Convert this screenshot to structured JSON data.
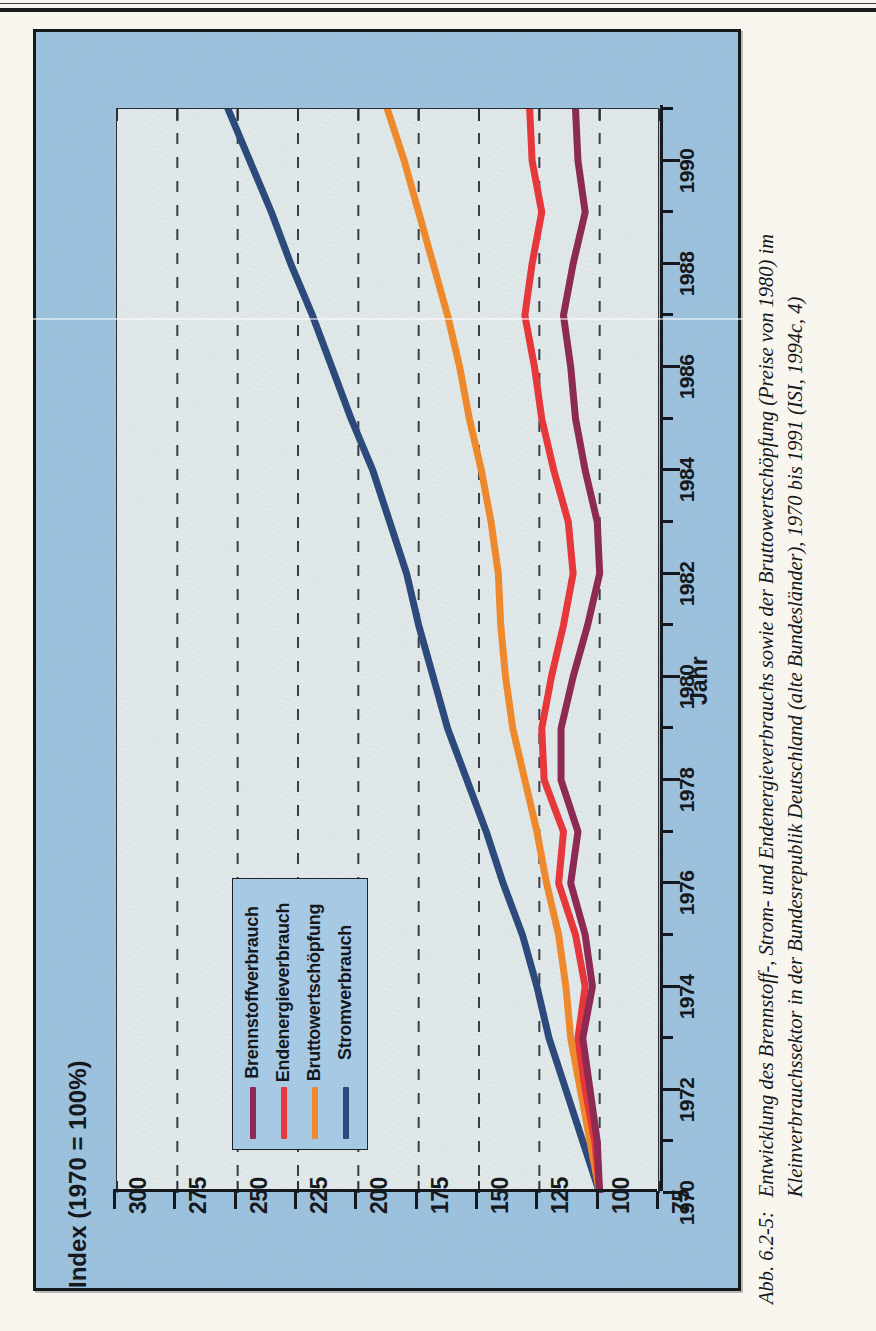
{
  "figure": {
    "caption_number": "Abb. 6.2-5:",
    "caption_text": "Entwicklung des Brennstoff-, Strom- und Endenergieverbrauchs sowie der Bruttowertschöpfung (Preise von 1980) im Kleinverbrauchssektor in der Bundesrepublik Deutschland (alte Bundesländer), 1970 bis 1991 (ISI, 1994c, 4)"
  },
  "colors": {
    "panel_background": "#9cc3e0",
    "plot_background": "#e4ecee",
    "legend_background": "#a8cbe6",
    "axis": "#15181c",
    "gridline": "#3a3f46",
    "stromverbrauch": "#2c4a7c",
    "bruttowertschoepfung": "#f08a2c",
    "endenergieverbrauch": "#e8383c",
    "brennstoffverbrauch": "#8e2a55"
  },
  "chart_data": {
    "type": "line",
    "title": "",
    "orientation": "rotated-90-ccw",
    "xlabel": "Jahr",
    "ylabel": "Index (1970 = 100%)",
    "xlim": [
      1970,
      1991
    ],
    "ylim": [
      75,
      300
    ],
    "yticks": [
      300,
      275,
      250,
      225,
      200,
      175,
      150,
      125,
      100,
      75
    ],
    "xticks_major": [
      1970,
      1972,
      1974,
      1976,
      1978,
      1980,
      1982,
      1984,
      1986,
      1988,
      1990
    ],
    "xticks_minor": [
      1971,
      1973,
      1975,
      1977,
      1979,
      1981,
      1983,
      1985,
      1987,
      1989,
      1991
    ],
    "grid": "dashed-vertical-on-value-axis",
    "legend_position": "inner-lower-left",
    "x": [
      1970,
      1971,
      1972,
      1973,
      1974,
      1975,
      1976,
      1977,
      1978,
      1979,
      1980,
      1981,
      1982,
      1983,
      1984,
      1985,
      1986,
      1987,
      1988,
      1989,
      1990,
      1991
    ],
    "series": [
      {
        "name": "Stromverbrauch",
        "color": "#2c4a7c",
        "values": [
          100,
          107,
          114,
          121,
          126,
          132,
          140,
          147,
          155,
          163,
          169,
          175,
          180,
          187,
          194,
          203,
          211,
          219,
          228,
          236,
          245,
          254
        ]
      },
      {
        "name": "Bruttowertschöpfung",
        "color": "#f08a2c",
        "values": [
          100,
          104,
          108,
          112,
          114,
          117,
          122,
          126,
          131,
          136,
          139,
          141,
          142,
          145,
          149,
          154,
          158,
          163,
          169,
          175,
          181,
          188
        ]
      },
      {
        "name": "Endenergieverbrauch",
        "color": "#e8383c",
        "values": [
          100,
          102,
          106,
          109,
          106,
          110,
          117,
          115,
          123,
          124,
          120,
          115,
          111,
          113,
          119,
          124,
          127,
          131,
          128,
          124,
          128,
          129
        ]
      },
      {
        "name": "Brennstoffverbrauch",
        "color": "#8e2a55",
        "values": [
          100,
          101,
          104,
          107,
          103,
          106,
          112,
          109,
          116,
          116,
          111,
          105,
          100,
          101,
          106,
          110,
          112,
          115,
          111,
          106,
          109,
          110
        ]
      }
    ]
  },
  "legend": {
    "items": [
      {
        "label": "Stromverbrauch",
        "color": "#2c4a7c"
      },
      {
        "label": "Bruttowertschöpfung",
        "color": "#f08a2c"
      },
      {
        "label": "Endenergieverbrauch",
        "color": "#e8383c"
      },
      {
        "label": "Brennstoffverbrauch",
        "color": "#8e2a55"
      }
    ]
  }
}
